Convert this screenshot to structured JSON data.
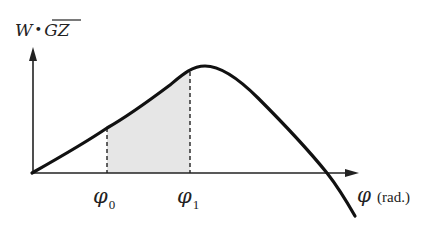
{
  "diagram": {
    "y_axis": {
      "label_main": "W",
      "label_dot": "•",
      "label_overline": "GZ"
    },
    "x_axis": {
      "label_symbol": "φ",
      "label_unit": "(rad.)"
    },
    "markers": [
      {
        "symbol": "φ",
        "subscript": "0"
      },
      {
        "symbol": "φ",
        "subscript": "1"
      }
    ],
    "colors": {
      "curve": "#111111",
      "axes": "#222222",
      "shade": "#e6e6e6",
      "dashes": "#222222"
    },
    "shaded_region": "area under curve between φ0 and φ1"
  }
}
